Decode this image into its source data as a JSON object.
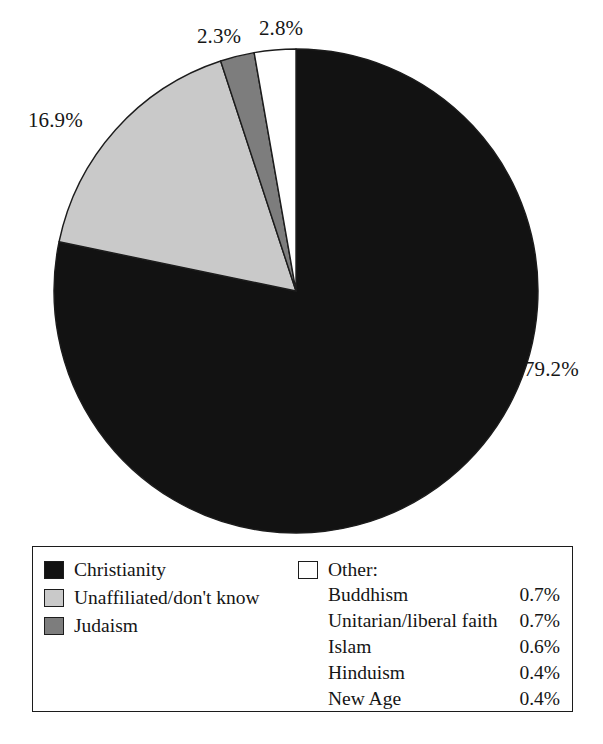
{
  "chart_data": {
    "type": "pie",
    "title": "",
    "subtitle": "",
    "xlabel": "",
    "ylabel": "",
    "legend_position": "bottom",
    "grid": false,
    "start_angle_deg": 0,
    "direction": "clockwise",
    "categories": [
      "Christianity",
      "Unaffiliated/don't know",
      "Judaism",
      "Other"
    ],
    "values": [
      79.2,
      16.9,
      2.3,
      2.8
    ],
    "value_labels": [
      "79.2%",
      "16.9%",
      "2.3%",
      "2.8%"
    ],
    "slice_colors": [
      "#121212",
      "#c9c9c9",
      "#7d7d7d",
      "#ffffff"
    ],
    "breakdown": {
      "parent": "Other",
      "items": [
        {
          "name": "Buddhism",
          "value": 0.7,
          "label": "0.7%"
        },
        {
          "name": "Unitarian/liberal faith",
          "value": 0.7,
          "label": "0.7%"
        },
        {
          "name": "Islam",
          "value": 0.6,
          "label": "0.6%"
        },
        {
          "name": "Hinduism",
          "value": 0.4,
          "label": "0.4%"
        },
        {
          "name": "New Age",
          "value": 0.4,
          "label": "0.4%"
        }
      ]
    }
  },
  "labels": {
    "christianity_pct": "79.2%",
    "unaffiliated_pct": "16.9%",
    "judaism_pct": "2.3%",
    "other_pct": "2.8%"
  },
  "legend": {
    "main_entries": [
      {
        "label": "Christianity",
        "color": "#121212"
      },
      {
        "label": "Unaffiliated/don't know",
        "color": "#c9c9c9"
      },
      {
        "label": "Judaism",
        "color": "#7d7d7d"
      }
    ],
    "other_header": {
      "label": "Other:",
      "color": "#ffffff"
    },
    "other_items": [
      {
        "name": "Buddhism",
        "value": "0.7%"
      },
      {
        "name": "Unitarian/liberal faith",
        "value": "0.7%"
      },
      {
        "name": "Islam",
        "value": "0.6%"
      },
      {
        "name": "Hinduism",
        "value": "0.4%"
      },
      {
        "name": "New Age",
        "value": "0.4%"
      }
    ]
  },
  "style": {
    "outline_color": "#1c1c1c",
    "background": "#ffffff"
  }
}
